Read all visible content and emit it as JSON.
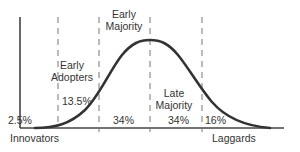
{
  "diagram": {
    "segments": [
      {
        "name": "Innovators",
        "label": "Innovators",
        "percent": "2.5%"
      },
      {
        "name": "Early Adopters",
        "label_line1": "Early",
        "label_line2": "Adopters",
        "percent": "13.5%"
      },
      {
        "name": "Early Majority",
        "label_line1": "Early",
        "label_line2": "Majority",
        "percent": "34%"
      },
      {
        "name": "Late Majority",
        "label_line1": "Late",
        "label_line2": "Majority",
        "percent": "34%"
      },
      {
        "name": "Laggards",
        "label": "Laggards",
        "percent": "16%"
      }
    ],
    "colors": {
      "curve": "#333333",
      "axis": "#444444",
      "dashed": "#777777",
      "text": "#333333"
    }
  }
}
